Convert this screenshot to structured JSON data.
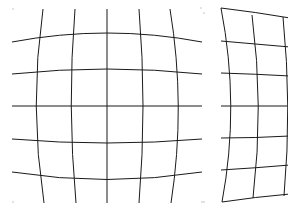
{
  "diagram": {
    "line_color": "#1a1a1a",
    "background": "#ffffff",
    "panels": [
      {
        "name": "barrel-distortion",
        "horizontal_lines": [
          "M12,42 Q107,24 202,42",
          "M12,74 Q107,64 202,74",
          "M12,106 L202,106",
          "M12,139 Q107,147 202,139",
          "M12,172 Q107,187 202,172"
        ],
        "vertical_lines": [
          "M43,9 Q29,106 44,203",
          "M75,9 Q67,106 76,203",
          "M107,9 L107,203",
          "M139,9 Q147,106 139,203",
          "M170,9 Q186,106 171,203"
        ],
        "corner_dots": [
          [
            13,
            9
          ],
          [
            201,
            8
          ],
          [
            13,
            202
          ],
          [
            202,
            202
          ]
        ]
      },
      {
        "name": "pincushion-distortion",
        "horizontal_lines": [
          "M221,8 Q255,12 290,18",
          "M221,41 Q255,44 290,47",
          "M221,73 Q255,74 290,76",
          "M221,106 L290,106",
          "M221,138 Q255,138 290,136",
          "M221,170 Q255,168 290,165",
          "M222,202 Q255,197 290,194"
        ],
        "vertical_lines": [
          "M221,8 Q240,106 222,202",
          "M252,15 Q264,106 253,198",
          "M283,17 Q292,106 284,196"
        ],
        "corner_dots": [
          [
            204,
            13
          ],
          [
            204,
            202
          ]
        ]
      }
    ]
  }
}
